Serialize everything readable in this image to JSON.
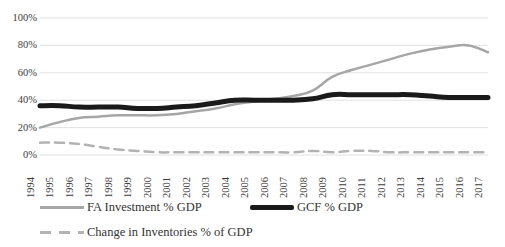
{
  "chart_data": {
    "type": "line",
    "title": "",
    "subtitle": "",
    "xlabel": "",
    "ylabel": "",
    "grid": true,
    "legend_position": "bottom",
    "ylim": [
      0,
      100
    ],
    "ytick_labels": [
      "100%",
      "80%",
      "60%",
      "40%",
      "20%",
      "0%"
    ],
    "ytick_values": [
      100,
      80,
      60,
      40,
      20,
      0
    ],
    "categories": [
      "1994",
      "1995",
      "1996",
      "1997",
      "1998",
      "1999",
      "2000",
      "2001",
      "2002",
      "2003",
      "2004",
      "2005",
      "2006",
      "2007",
      "2008",
      "2009",
      "2010",
      "2011",
      "2012",
      "2013",
      "2014",
      "2015",
      "2016",
      "2017"
    ],
    "series": [
      {
        "name": "FA Investment % GDP",
        "color": "#a6a6a6",
        "style": "solid",
        "width": 2.5,
        "values": [
          20,
          24,
          27,
          28,
          29,
          29,
          29,
          30,
          32,
          34,
          37,
          39,
          41,
          43,
          47,
          57,
          62,
          66,
          70,
          74,
          77,
          79,
          80,
          75
        ]
      },
      {
        "name": "GCF % GDP",
        "color": "#1a1a1a",
        "style": "solid",
        "width": 5,
        "values": [
          36,
          36,
          35,
          35,
          35,
          34,
          34,
          35,
          36,
          38,
          40,
          40,
          40,
          40,
          41,
          44,
          44,
          44,
          44,
          44,
          43,
          42,
          42,
          42
        ]
      },
      {
        "name": "Change in Inventories % of GDP",
        "color": "#b3b3b3",
        "style": "dashed",
        "width": 2.5,
        "values": [
          9,
          9,
          8,
          6,
          4,
          3,
          2,
          2,
          2,
          2,
          2,
          2,
          2,
          2,
          3,
          2,
          3,
          3,
          2,
          2,
          2,
          2,
          2,
          2
        ]
      }
    ]
  },
  "legend": {
    "items": [
      {
        "label": "FA Investment % GDP",
        "swatch": "solid-gray"
      },
      {
        "label": "GCF % GDP",
        "swatch": "solid-black"
      },
      {
        "label": "Change in Inventories % of GDP",
        "swatch": "dashed-gray"
      }
    ]
  }
}
